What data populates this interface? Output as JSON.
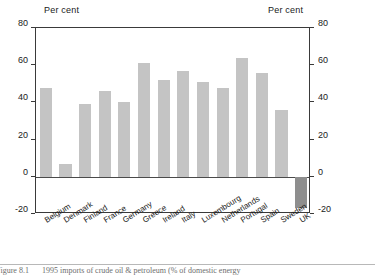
{
  "figure": {
    "number": "Figure 8.1",
    "caption": "1995 imports of crude oil & petroleum (% of domestic energy"
  },
  "axis": {
    "left_title": "Per cent",
    "right_title": "Per cent",
    "ticks": [
      "80",
      "60",
      "40",
      "20",
      "0",
      "-20"
    ]
  },
  "colors": {
    "positive_bar": "#c4c4c4",
    "negative_bar": "#8e8e8e",
    "axis": "#3a3a3a",
    "text": "#1a1a1a"
  },
  "chart_data": {
    "type": "bar",
    "title": "1995 imports of crude oil & petroleum (% of domestic energy",
    "xlabel": "",
    "ylabel": "Per cent",
    "ylim": [
      -20,
      80
    ],
    "yticks": [
      -20,
      0,
      20,
      40,
      60,
      80
    ],
    "grid": false,
    "legend": "none",
    "categories": [
      "Belgium",
      "Denmark",
      "Finland",
      "France",
      "Germany",
      "Greece",
      "Ireland",
      "Italy",
      "Luxembourg",
      "Netherlands",
      "Portugal",
      "Spain",
      "Sweden",
      "UK"
    ],
    "values": [
      48,
      7,
      39,
      46,
      40,
      61,
      52,
      57,
      51,
      48,
      64,
      56,
      36,
      -17
    ]
  }
}
